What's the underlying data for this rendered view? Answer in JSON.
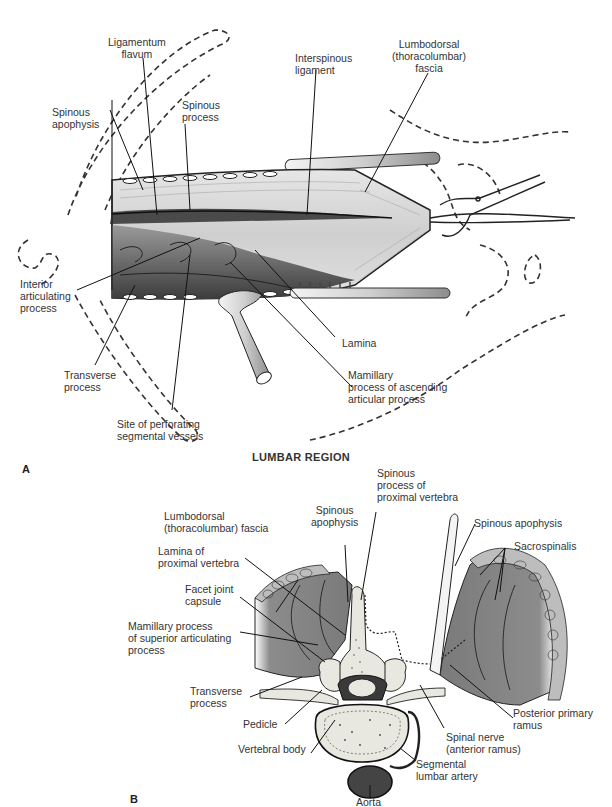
{
  "figure": {
    "region_title": "LUMBAR REGION",
    "panel_a": {
      "letter": "A",
      "labels": {
        "ligamentum_flavum": "Ligamentum\nflavum",
        "interspinous_ligament": "Interspinous\nligament",
        "lumbodorsal_fascia": "Lumbodorsal\n(thoracolumbar)\nfascia",
        "spinous_apophysis": "Spinous\napophysis",
        "spinous_process": "Spinous\nprocess",
        "interior_articulating_process": "Interior\narticulating\nprocess",
        "transverse_process": "Transverse\nprocess",
        "site_of_perforating": "Site of perforating\nsegmental vessels",
        "lamina": "Lamina",
        "mamillary_process": "Mamillary\nprocess of ascending\narticular process"
      }
    },
    "panel_b": {
      "letter": "B",
      "labels": {
        "spinous_process_proximal": "Spinous\nprocess of\nproximal vertebra",
        "lumbodorsal_fascia": "Lumbodorsal\n(thoracolumbar) fascia",
        "spinous_apophysis_left": "Spinous\napophysis",
        "spinous_apophysis_right": "Spinous apophysis",
        "sacrospinalis": "Sacrospinalis",
        "lamina_proximal": "Lamina of\nproximal vertebra",
        "facet_joint_capsule": "Facet joint\ncapsule",
        "mamillary_process": "Mamillary process\nof superior articulating\nprocess",
        "transverse_process": "Transverse\nprocess",
        "pedicle": "Pedicle",
        "vertebral_body": "Vertebral body",
        "posterior_primary_ramus": "Posterior primary\nramus",
        "spinal_nerve": "Spinal nerve\n(anterior ramus)",
        "segmental_lumbar_artery": "Segmental\nlumbar artery",
        "aorta": "Aorta"
      }
    },
    "colors": {
      "muscle": "#8a8a8a",
      "bone": "#e8e8e0",
      "dark": "#3a3a3a",
      "tissue_light": "#d6d6d6"
    }
  }
}
